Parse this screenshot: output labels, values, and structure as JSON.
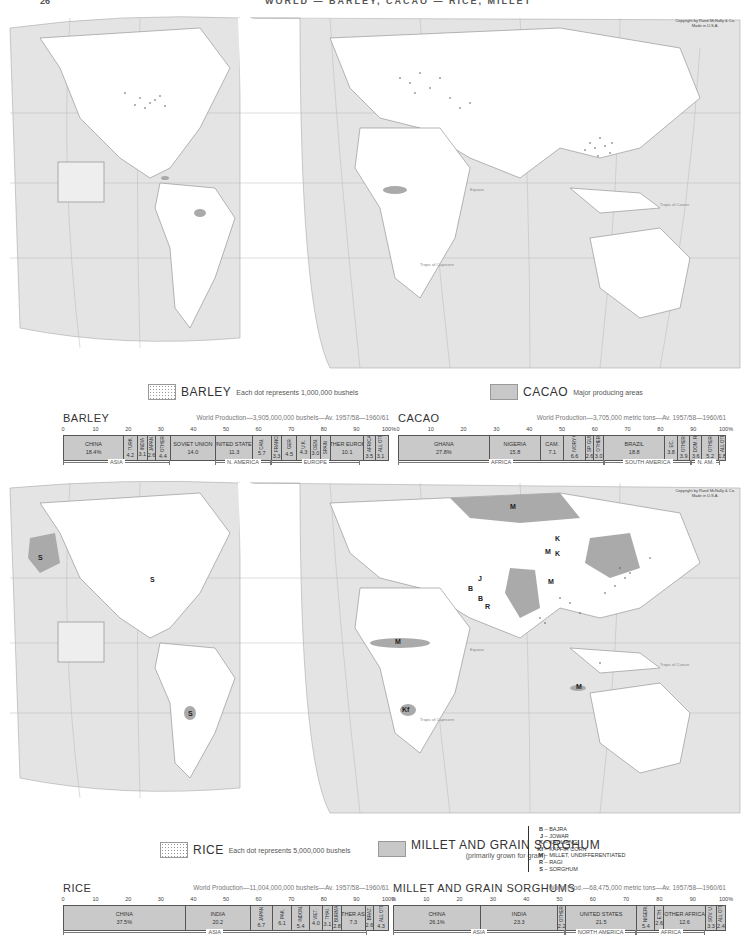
{
  "page": {
    "number": "26",
    "title": "WORLD — BARLEY, CACAO — RICE, MILLET"
  },
  "map_top": {
    "name": "world-map-barley-cacao",
    "copyright": [
      "Copyright by Rand McNally & Co.",
      "Made in U.S.A."
    ],
    "labels": [
      "Tropic of Cancer",
      "Equator",
      "Tropic of Capricorn"
    ]
  },
  "map_bottom": {
    "name": "world-map-rice-millet",
    "copyright": [
      "Copyright by Rand McNally & Co.",
      "Made in U.S.A."
    ],
    "labels": [
      "Tropic of Cancer",
      "Equator",
      "Tropic of Capricorn"
    ],
    "region_letters": [
      "S",
      "S",
      "S",
      "M",
      "M",
      "M",
      "M",
      "K",
      "K",
      "B",
      "J",
      "B",
      "R",
      "M",
      "Kf"
    ]
  },
  "legends": {
    "barley": {
      "name": "BARLEY",
      "desc": "Each dot represents 1,000,000 bushels"
    },
    "cacao": {
      "name": "CACAO",
      "desc": "Major producing areas"
    },
    "rice": {
      "name": "RICE",
      "desc": "Each dot represents 5,000,000 bushels"
    },
    "millet": {
      "name": "MILLET AND GRAIN SORGHUM",
      "desc": "(primarily grown for grain)"
    },
    "millet_key": [
      {
        "code": "B",
        "label": "BAJRA"
      },
      {
        "code": "J",
        "label": "JOWAR"
      },
      {
        "code": "K",
        "label": "KAOLIANG"
      },
      {
        "code": "Kf",
        "label": "KAFFIR CORN"
      },
      {
        "code": "M",
        "label": "MILLET, UNDIFFERENTIATED"
      },
      {
        "code": "R",
        "label": "RAGI"
      },
      {
        "code": "S",
        "label": "SORGHUM"
      }
    ]
  },
  "axis_ticks": [
    "0",
    "10",
    "20",
    "30",
    "40",
    "50",
    "60",
    "70",
    "80",
    "90",
    "100%"
  ],
  "chart_data": [
    {
      "type": "bar",
      "stacked": true,
      "title": "BARLEY",
      "subtitle": "World Production—3,905,000,000 bushels—Av. 1957/58—1960/61",
      "xlim": [
        0,
        100
      ],
      "xlabel": "percent of world production",
      "categories": [
        "CHINA",
        "TURK.",
        "INDIA",
        "JAPAN",
        "OTHER ASIA",
        "SOVIET UNION",
        "UNITED STATES",
        "CAN.",
        "FRANCE",
        "GER.",
        "U.K.",
        "DEN.",
        "SPAIN",
        "OTHER EUROPE",
        "AFRICA",
        "ALL OTHERS"
      ],
      "values": [
        18.4,
        4.2,
        3.1,
        2.6,
        4.4,
        14.0,
        11.3,
        5.7,
        3.3,
        4.5,
        4.3,
        3.0,
        3.2,
        10.1,
        3.5,
        3.1
      ],
      "labels": [
        "18.4%",
        "4.2",
        "3.1",
        "2.6",
        "4.4",
        "14.0",
        "11.3",
        "5.7",
        "3.3",
        "4.5",
        "4.3",
        "3.0",
        "",
        "10.1",
        "3.5",
        "3.1"
      ],
      "regions": [
        {
          "name": "ASIA",
          "from": 0,
          "to": 32.7
        },
        {
          "name": "N. AMERICA",
          "from": 46.7,
          "to": 63.7
        },
        {
          "name": "EUROPE",
          "from": 63.7,
          "to": 91.1
        }
      ]
    },
    {
      "type": "bar",
      "stacked": true,
      "title": "CACAO",
      "subtitle": "World Production—3,705,000 metric tons—Av. 1957/58—1960/61",
      "xlim": [
        0,
        100
      ],
      "categories": [
        "GHANA",
        "NIGERIA",
        "CAM.",
        "IVORY COAST",
        "SP. GUI.",
        "OTHER",
        "BRAZIL",
        "EC.",
        "OTHER S. AM.",
        "DOM. R.",
        "OTHER N. AM.",
        "ALL OTHERS"
      ],
      "values": [
        27.8,
        15.8,
        7.1,
        6.6,
        2.6,
        3.0,
        18.8,
        3.8,
        3.9,
        3.6,
        5.2,
        1.8
      ],
      "labels": [
        "27.8%",
        "15.8",
        "7.1",
        "6.6",
        "2.6",
        "3.0",
        "18.8",
        "3.8",
        "3.9",
        "3.6",
        "5.2",
        "1.8"
      ],
      "regions": [
        {
          "name": "AFRICA",
          "from": 0,
          "to": 62.9
        },
        {
          "name": "SOUTH AMERICA",
          "from": 62.9,
          "to": 89.4
        },
        {
          "name": "N. AM.",
          "from": 89.4,
          "to": 98.2
        }
      ]
    },
    {
      "type": "bar",
      "stacked": true,
      "title": "RICE",
      "subtitle": "World Production—11,004,000,000 bushels—Av. 1957/58—1960/61",
      "xlim": [
        0,
        100
      ],
      "categories": [
        "CHINA",
        "INDIA",
        "JAPAN",
        "PAK.",
        "INDON.",
        "VIET.",
        "THAI.",
        "BURMA",
        "OTHER ASIA",
        "BRAZ.",
        "ALL OTHERS"
      ],
      "values": [
        37.5,
        20.2,
        6.7,
        6.1,
        5.4,
        4.0,
        3.1,
        2.8,
        7.3,
        2.6,
        4.3
      ],
      "labels": [
        "37.5%",
        "20.2",
        "6.7",
        "6.1",
        "5.4",
        "4.0",
        "3.1",
        "2.8",
        "7.3",
        "2.6",
        "4.3"
      ],
      "regions": [
        {
          "name": "ASIA",
          "from": 0,
          "to": 93.1
        }
      ]
    },
    {
      "type": "bar",
      "stacked": true,
      "title": "MILLET AND GRAIN SORGHUMS",
      "subtitle": "World Prod.—68,475,000 metric tons—Av. 1957/58—1960/61",
      "xlim": [
        0,
        100
      ],
      "categories": [
        "CHINA",
        "INDIA",
        "OTHERS",
        "UNITED STATES",
        "NIGERIA",
        "ETH.",
        "OTHER AFRICA",
        "SOV. U.",
        "ALL OTHERS"
      ],
      "values": [
        26.1,
        23.3,
        2.2,
        21.5,
        5.4,
        2.6,
        12.6,
        3.3,
        2.4
      ],
      "labels": [
        "26.1%",
        "23.3",
        "2.2",
        "21.5",
        "5.4",
        "2.6",
        "12.6",
        "3.3",
        "2.4"
      ],
      "regions": [
        {
          "name": "ASIA",
          "from": 0,
          "to": 51.6
        },
        {
          "name": "NORTH AMERICA",
          "from": 51.6,
          "to": 73.1
        },
        {
          "name": "AFRICA",
          "from": 73.1,
          "to": 93.7
        }
      ]
    }
  ]
}
